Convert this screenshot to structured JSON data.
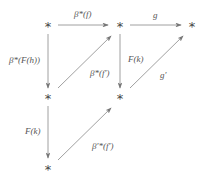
{
  "diagram": {
    "type": "commutative-diagram",
    "line_color": "#777777",
    "nodes": [
      {
        "id": "n1",
        "label": "*",
        "x": 48,
        "y": 25
      },
      {
        "id": "n2",
        "label": "*",
        "x": 120,
        "y": 25
      },
      {
        "id": "n3",
        "label": "*",
        "x": 192,
        "y": 25
      },
      {
        "id": "n4",
        "label": "*",
        "x": 48,
        "y": 97
      },
      {
        "id": "n5",
        "label": "*",
        "x": 120,
        "y": 97
      },
      {
        "id": "n6",
        "label": "*",
        "x": 48,
        "y": 168
      }
    ],
    "edges": [
      {
        "from": "n1",
        "to": "n2",
        "label": "β*(f)"
      },
      {
        "from": "n2",
        "to": "n3",
        "label": "g"
      },
      {
        "from": "n1",
        "to": "n4",
        "label": "β*(F(h))"
      },
      {
        "from": "n4",
        "to": "n2",
        "label": "β*(f′)"
      },
      {
        "from": "n2",
        "to": "n5",
        "label": "F(k)"
      },
      {
        "from": "n5",
        "to": "n3",
        "label": "g′"
      },
      {
        "from": "n4",
        "to": "n6",
        "label": "F(k)"
      },
      {
        "from": "n6",
        "to": "n5",
        "label": "β′*(f′)"
      }
    ]
  }
}
